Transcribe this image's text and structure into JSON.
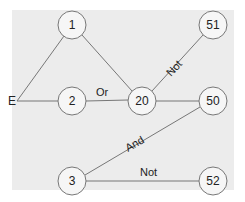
{
  "diagram": {
    "start_label": "E",
    "nodes": [
      {
        "id": "1",
        "label": "1",
        "x": 72,
        "y": 25
      },
      {
        "id": "2",
        "label": "2",
        "x": 72,
        "y": 101
      },
      {
        "id": "20",
        "label": "20",
        "x": 142,
        "y": 101
      },
      {
        "id": "51",
        "label": "51",
        "x": 213,
        "y": 25
      },
      {
        "id": "50",
        "label": "50",
        "x": 213,
        "y": 101
      },
      {
        "id": "3",
        "label": "3",
        "x": 72,
        "y": 181
      },
      {
        "id": "52",
        "label": "52",
        "x": 213,
        "y": 181
      }
    ],
    "edges": [
      {
        "from": "E",
        "to": "1",
        "label": ""
      },
      {
        "from": "E",
        "to": "2",
        "label": ""
      },
      {
        "from": "1",
        "to": "20",
        "label": ""
      },
      {
        "from": "2",
        "to": "20",
        "label": "Or"
      },
      {
        "from": "20",
        "to": "51",
        "label": "Not"
      },
      {
        "from": "20",
        "to": "50",
        "label": ""
      },
      {
        "from": "3",
        "to": "50",
        "label": "And"
      },
      {
        "from": "3",
        "to": "52",
        "label": "Not"
      }
    ]
  }
}
